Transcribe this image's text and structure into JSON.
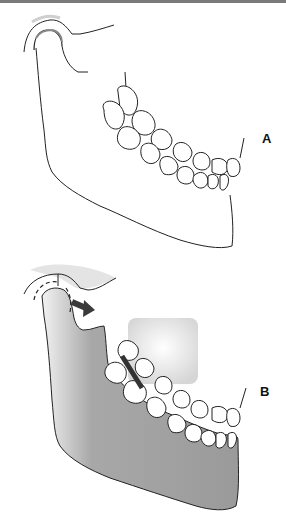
{
  "figure": {
    "panels": [
      {
        "id": "A",
        "label": "A",
        "description": "Outline of mandible in normal occlusion with condyle seated in fossa"
      },
      {
        "id": "B",
        "label": "B",
        "description": "Shaded mandible with condyle displaced (dashed outline) and arrow showing anterior movement; dark bar at premolar contact; shaded region above maxillary teeth"
      }
    ],
    "colors": {
      "line": "#222222",
      "bone_fill": "#9a9a9a",
      "bone_fill_light": "#e0e0e0",
      "arrow": "#3a3a3a",
      "shadow": "#d6d6d6",
      "top_rule": "#7a7a7a"
    },
    "icons": {
      "arrow": "arrow-right-down-icon"
    }
  }
}
